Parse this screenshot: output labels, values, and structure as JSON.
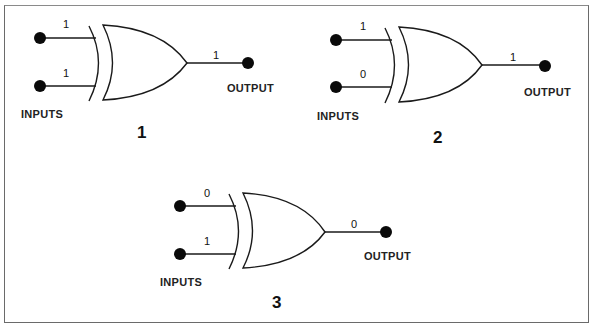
{
  "figure": {
    "colors": {
      "line": "#1a1a1a",
      "dot": "#0a0a0a",
      "border": "#6a6a6a",
      "background": "#ffffff"
    },
    "gates": [
      {
        "id": 1,
        "number_label": "1",
        "type": "XOR",
        "inputs": [
          "1",
          "1"
        ],
        "output": "1",
        "inputs_label": "INPUTS",
        "output_label": "OUTPUT"
      },
      {
        "id": 2,
        "number_label": "2",
        "type": "XOR",
        "inputs": [
          "1",
          "0"
        ],
        "output": "1",
        "inputs_label": "INPUTS",
        "output_label": "OUTPUT"
      },
      {
        "id": 3,
        "number_label": "3",
        "type": "XOR",
        "inputs": [
          "0",
          "1"
        ],
        "output": "0",
        "inputs_label": "INPUTS",
        "output_label": "OUTPUT"
      }
    ]
  }
}
